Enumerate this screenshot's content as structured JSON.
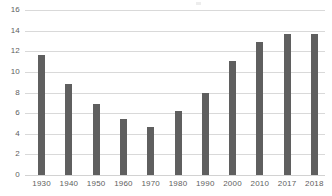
{
  "chart_data": {
    "type": "bar",
    "title": "",
    "subtitle": "",
    "xlabel": "",
    "ylabel": "",
    "categories": [
      "1930",
      "1940",
      "1950",
      "1960",
      "1970",
      "1980",
      "1990",
      "2000",
      "2010",
      "2017",
      "2018"
    ],
    "values": [
      11.6,
      8.8,
      6.9,
      5.4,
      4.7,
      6.2,
      8.0,
      11.1,
      12.9,
      13.7,
      13.7
    ],
    "series": [
      {
        "name": "",
        "values": [
          11.6,
          8.8,
          6.9,
          5.4,
          4.7,
          6.2,
          8.0,
          11.1,
          12.9,
          13.7,
          13.7
        ]
      }
    ],
    "ylim": [
      0,
      16
    ],
    "yticks": [
      0,
      2,
      4,
      6,
      8,
      10,
      12,
      14,
      16
    ],
    "ytick_labels": [
      "0",
      "2",
      "4",
      "6",
      "8",
      "10",
      "12",
      "14",
      "16"
    ],
    "xtick_labels": [
      "1930",
      "1940",
      "1950",
      "1960",
      "1970",
      "1980",
      "1990",
      "2000",
      "2010",
      "2017",
      "2018"
    ],
    "grid": "horizontal",
    "legend": "none",
    "annotations": [],
    "colors": {
      "bar": "#5f5f5f",
      "gridline": "#d9d9d9",
      "axis_text": "#5e5e5e",
      "background": "#ffffff"
    }
  }
}
